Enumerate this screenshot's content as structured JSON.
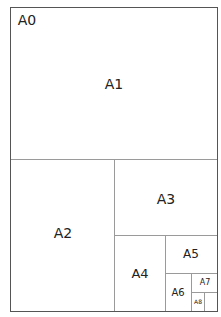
{
  "diagram": {
    "sheets": [
      {
        "id": "A0",
        "label": "A0"
      },
      {
        "id": "A1",
        "label": "A1"
      },
      {
        "id": "A2",
        "label": "A2"
      },
      {
        "id": "A3",
        "label": "A3"
      },
      {
        "id": "A4",
        "label": "A4"
      },
      {
        "id": "A5",
        "label": "A5"
      },
      {
        "id": "A6",
        "label": "A6"
      },
      {
        "id": "A7",
        "label": "A7"
      },
      {
        "id": "A8",
        "label": "A8"
      }
    ]
  }
}
